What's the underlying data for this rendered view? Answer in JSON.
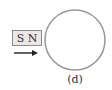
{
  "figure": {
    "label": "(d)",
    "magnet": {
      "south_pole": "S",
      "north_pole": "N",
      "fill_color": "#ebe7e7",
      "border_color": "#8a8a8a"
    },
    "motion_arrow": {
      "direction": "right",
      "color": "#222222"
    },
    "loop": {
      "shape": "circle",
      "stroke_color": "#9a9a9a"
    }
  }
}
